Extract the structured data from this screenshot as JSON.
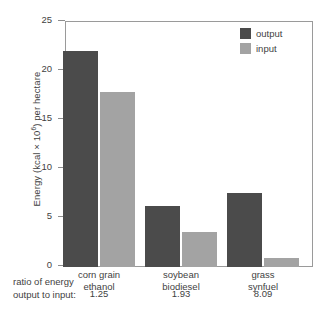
{
  "chart_data": {
    "type": "bar",
    "title": "",
    "xlabel": "",
    "ylabel": "Energy (kcal × 10⁶) per hectare",
    "ylabel_parts": {
      "pre": "Energy (kcal × 10",
      "sup": "6",
      "post": ") per hectare"
    },
    "categories": [
      "corn grain ethanol",
      "soybean biodiesel",
      "grass synfuel"
    ],
    "category_lines": [
      [
        "corn grain",
        "ethanol"
      ],
      [
        "soybean",
        "biodiesel"
      ],
      [
        "grass",
        "synfuel"
      ]
    ],
    "series": [
      {
        "name": "output",
        "values": [
          22.0,
          6.2,
          7.6
        ],
        "color": "#4b4b4b"
      },
      {
        "name": "input",
        "values": [
          17.9,
          3.6,
          0.95
        ],
        "color": "#a3a3a3"
      }
    ],
    "ylim": [
      0,
      25
    ],
    "yticks": [
      0,
      5,
      10,
      15,
      20,
      25
    ],
    "ytick_labels": [
      "0",
      "5",
      "10",
      "15",
      "20",
      "25"
    ],
    "grid": false,
    "legend_position": "top-right",
    "annotations": {
      "ratio_label_lines": [
        "ratio of energy",
        "output to input:"
      ],
      "ratio_values": [
        "1.25",
        "1.93",
        "8.09"
      ]
    }
  },
  "colors": {
    "output": "#4b4b4b",
    "input": "#a3a3a3",
    "axis": "#9a9a9a",
    "text": "#3f3f3f",
    "background": "#ffffff"
  }
}
